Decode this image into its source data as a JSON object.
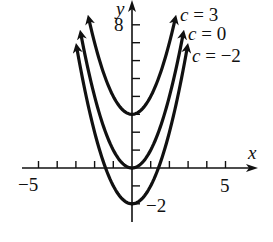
{
  "chart_data": {
    "type": "line",
    "title": "",
    "xlabel": "x",
    "ylabel": "y",
    "xlim": [
      -5.5,
      6
    ],
    "ylim": [
      -3,
      9
    ],
    "grid": false,
    "x_ticks": [
      -5,
      -4,
      -3,
      -2,
      -1,
      1,
      2,
      3,
      4,
      5
    ],
    "x_tick_labels": [
      {
        "value": -5,
        "label": "−5"
      },
      {
        "value": 5,
        "label": "5"
      }
    ],
    "y_ticks": [
      -2,
      -1,
      1,
      2,
      3,
      4,
      5,
      6,
      7,
      8
    ],
    "y_tick_labels": [
      {
        "value": 8,
        "label": "8"
      },
      {
        "value": -2,
        "label": "−2"
      }
    ],
    "function": "y = x^2 + c",
    "series": [
      {
        "name": "c = 3",
        "c": 3,
        "x_range": [
          -2.3,
          2.3
        ],
        "vertex": [
          0,
          3
        ]
      },
      {
        "name": "c = 0",
        "c": 0,
        "x_range": [
          -2.73,
          2.73
        ],
        "vertex": [
          0,
          0
        ]
      },
      {
        "name": "c = −2",
        "c": -2,
        "x_range": [
          -2.95,
          2.95
        ],
        "vertex": [
          0,
          -2
        ]
      }
    ],
    "legend_position": "upper right, labels at curve ends"
  },
  "labels": {
    "x_axis": "x",
    "y_axis": "y",
    "tick_x_neg5": "−5",
    "tick_x_5": "5",
    "tick_y_8": "8",
    "tick_y_neg2": "−2",
    "curve_c3": "c = 3",
    "curve_c0": "c = 0",
    "curve_cneg2": "c = −2"
  },
  "layout": {
    "origin_px": [
      132,
      168
    ],
    "unit_x_px": 18.7,
    "unit_y_px": 17.9,
    "curve_color": "#111111",
    "axis_color": "#111111"
  }
}
